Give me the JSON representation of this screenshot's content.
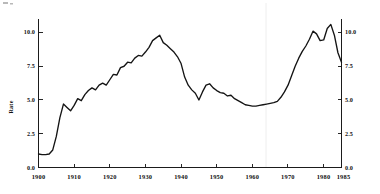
{
  "chart_data": {
    "type": "line",
    "title": "",
    "xlabel": "",
    "ylabel": "Rate",
    "ylabel_right": "",
    "xlim": [
      1900,
      1985
    ],
    "ylim": [
      0.0,
      11.0
    ],
    "grid": false,
    "legend": null,
    "x_ticks": [
      1900,
      1910,
      1920,
      1930,
      1940,
      1950,
      1960,
      1970,
      1980,
      1985
    ],
    "x_ticklabels": [
      "1900",
      "1910",
      "1920",
      "1930",
      "1940",
      "1950",
      "1960",
      "1970",
      "1980",
      "1985"
    ],
    "y_ticks": [
      0.0,
      2.5,
      5.0,
      7.5,
      10.0
    ],
    "y_ticklabels": [
      "0.0",
      "2.5",
      "5.0",
      "7.5",
      "10.0"
    ],
    "y_ticks_right": [
      0.0,
      2.5,
      5.0,
      7.5,
      10.0
    ],
    "y_ticklabels_right": [
      "0.0",
      "2.5",
      "5.0",
      "7.5",
      "10.0"
    ],
    "series": [
      {
        "name": "Rate",
        "color": "#141414",
        "x": [
          1900,
          1901,
          1902,
          1903,
          1904,
          1905,
          1906,
          1907,
          1908,
          1909,
          1910,
          1911,
          1912,
          1913,
          1914,
          1915,
          1916,
          1917,
          1918,
          1919,
          1920,
          1921,
          1922,
          1923,
          1924,
          1925,
          1926,
          1927,
          1928,
          1929,
          1930,
          1931,
          1932,
          1933,
          1934,
          1935,
          1936,
          1937,
          1938,
          1939,
          1940,
          1941,
          1942,
          1943,
          1944,
          1945,
          1946,
          1947,
          1948,
          1949,
          1950,
          1951,
          1952,
          1953,
          1954,
          1955,
          1956,
          1957,
          1958,
          1959,
          1960,
          1961,
          1962,
          1963,
          1964,
          1965,
          1966,
          1967,
          1968,
          1969,
          1970,
          1971,
          1972,
          1973,
          1974,
          1975,
          1976,
          1977,
          1978,
          1979,
          1980,
          1981,
          1982,
          1983,
          1984,
          1985
        ],
        "y": [
          1.0,
          0.95,
          0.95,
          1.0,
          1.3,
          2.3,
          3.7,
          4.7,
          4.45,
          4.2,
          4.6,
          5.1,
          4.95,
          5.4,
          5.7,
          5.9,
          5.75,
          6.1,
          6.25,
          6.1,
          6.5,
          6.9,
          6.85,
          7.4,
          7.5,
          7.8,
          7.75,
          8.1,
          8.3,
          8.25,
          8.55,
          8.9,
          9.4,
          9.6,
          9.8,
          9.25,
          9.05,
          8.8,
          8.55,
          8.2,
          7.7,
          6.7,
          6.1,
          5.75,
          5.5,
          5.0,
          5.6,
          6.1,
          6.2,
          5.9,
          5.7,
          5.55,
          5.5,
          5.3,
          5.35,
          5.1,
          4.95,
          4.8,
          4.65,
          4.6,
          4.55,
          4.55,
          4.6,
          4.65,
          4.7,
          4.75,
          4.8,
          4.9,
          5.2,
          5.6,
          6.1,
          6.8,
          7.5,
          8.1,
          8.6,
          9.0,
          9.5,
          10.1,
          9.9,
          9.4,
          9.45,
          10.3,
          10.6,
          9.8,
          8.5,
          7.8
        ]
      }
    ]
  },
  "figure": {
    "background_color": "#ffffff",
    "line_color": "#141414",
    "axis_color": "#1b1b1b"
  }
}
